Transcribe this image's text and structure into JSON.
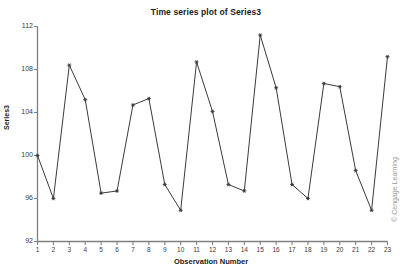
{
  "chart_data": {
    "type": "line",
    "title": "Time series plot of Series3",
    "xlabel": "Observation Number",
    "ylabel": "Series3",
    "x": [
      1,
      2,
      3,
      4,
      5,
      6,
      7,
      8,
      9,
      10,
      11,
      12,
      13,
      14,
      15,
      16,
      17,
      18,
      19,
      20,
      21,
      22,
      23
    ],
    "values": [
      100.0,
      96.0,
      108.4,
      105.2,
      96.5,
      96.7,
      104.7,
      105.3,
      97.3,
      94.9,
      108.7,
      104.1,
      97.3,
      96.7,
      111.2,
      106.3,
      97.3,
      96.0,
      106.7,
      106.4,
      98.6,
      94.9,
      109.2
    ],
    "series": [
      {
        "name": "Series3",
        "values": [
          100.0,
          96.0,
          108.4,
          105.2,
          96.5,
          96.7,
          104.7,
          105.3,
          97.3,
          94.9,
          108.7,
          104.1,
          97.3,
          96.7,
          111.2,
          106.3,
          97.3,
          96.0,
          106.7,
          106.4,
          98.6,
          94.9,
          109.2
        ]
      }
    ],
    "xlim": [
      1,
      23
    ],
    "ylim": [
      92,
      112
    ],
    "ytick_labels": [
      "92",
      "96",
      "100",
      "104",
      "108",
      "112"
    ],
    "ytick_values": [
      92,
      96,
      100,
      104,
      108,
      112
    ],
    "xtick_labels": [
      "1",
      "2",
      "3",
      "4",
      "5",
      "6",
      "7",
      "8",
      "9",
      "10",
      "11",
      "12",
      "13",
      "14",
      "15",
      "16",
      "17",
      "18",
      "19",
      "20",
      "21",
      "22",
      "23"
    ],
    "grid": false,
    "legend": false,
    "marker": "star-point",
    "line_color": "#3b3b3b",
    "axis_color": "#808080"
  },
  "watermark": {
    "text": "© Cengage Learning"
  }
}
